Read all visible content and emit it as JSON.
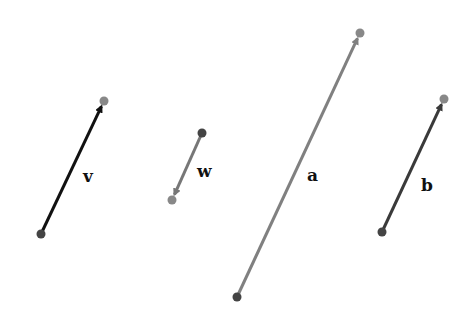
{
  "diagram": {
    "vectors": [
      {
        "name": "v",
        "label": "v",
        "tail": [
          41,
          234
        ],
        "head": [
          104,
          101
        ],
        "color": "#111111",
        "dot_tail": "#444444",
        "dot_head": "#888888",
        "label_pos": [
          83,
          182
        ]
      },
      {
        "name": "w",
        "label": "w",
        "tail": [
          202,
          133
        ],
        "head": [
          172,
          200
        ],
        "color": "#777777",
        "dot_tail": "#444444",
        "dot_head": "#888888",
        "label_pos": [
          197,
          177
        ]
      },
      {
        "name": "a",
        "label": "a",
        "tail": [
          237,
          297
        ],
        "head": [
          360,
          33
        ],
        "color": "#808080",
        "dot_tail": "#444444",
        "dot_head": "#888888",
        "label_pos": [
          307,
          181
        ]
      },
      {
        "name": "b",
        "label": "b",
        "tail": [
          382,
          232
        ],
        "head": [
          444,
          99
        ],
        "color": "#3a3a3a",
        "dot_tail": "#444444",
        "dot_head": "#888888",
        "label_pos": [
          421,
          191
        ]
      }
    ]
  }
}
